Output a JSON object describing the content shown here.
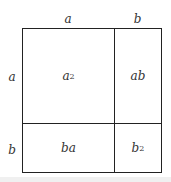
{
  "diagram": {
    "top_labels": [
      "a",
      "b"
    ],
    "side_labels": [
      "a",
      "b"
    ],
    "cells": {
      "top_left": {
        "base": "a",
        "exp": "2"
      },
      "top_right": {
        "text": "ab"
      },
      "bottom_left": {
        "text": "ba"
      },
      "bottom_right": {
        "base": "b",
        "exp": "2"
      }
    }
  }
}
